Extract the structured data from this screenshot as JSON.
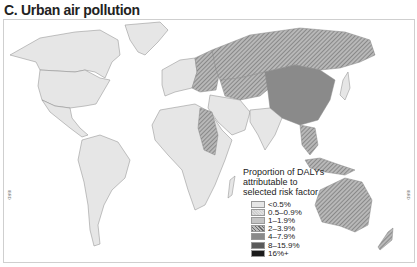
{
  "title": "C. Urban air pollution",
  "legend": {
    "title": "Proportion of DALYs attributable to selected risk factor",
    "items": [
      {
        "label": "<0.5%",
        "color": "#e6e6e6",
        "pattern": "plain"
      },
      {
        "label": "0.5–0.9%",
        "color": "#cfcfcf",
        "pattern": "dots"
      },
      {
        "label": "1–1.9%",
        "color": "#c4c4c4",
        "pattern": "plain"
      },
      {
        "label": "2–3.9%",
        "color": "#9a9a9a",
        "pattern": "hatch"
      },
      {
        "label": "4–7.9%",
        "color": "#8a8a8a",
        "pattern": "plain"
      },
      {
        "label": "8–15.9%",
        "color": "#5a5a5a",
        "pattern": "plain"
      },
      {
        "label": "16%+",
        "color": "#1a1a1a",
        "pattern": "plain"
      }
    ]
  },
  "side_labels": {
    "left": "IBRD",
    "right": "IBRD"
  },
  "regions": {
    "north_america": "<0.5%",
    "south_america": "<0.5%",
    "russia": "2–3.9%",
    "china": "4–7.9%",
    "eastern_europe": "2–3.9%",
    "sudan": "2–3.9%",
    "australia": "2–3.9%",
    "india": "1–1.9%",
    "africa": "<0.5%"
  }
}
